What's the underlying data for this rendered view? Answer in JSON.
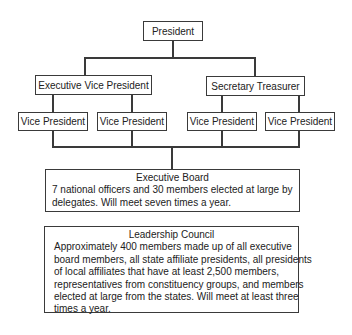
{
  "org_chart": {
    "nodes": {
      "president": "President",
      "executive_vice_president": "Executive Vice President",
      "secretary_treasurer": "Secretary Treasurer",
      "vice_presidents": [
        "Vice President",
        "Vice President",
        "Vice President",
        "Vice President"
      ]
    },
    "executive_board": {
      "title": "Executive Board",
      "lines": [
        "7 national officers and 30 members elected at large by",
        "delegates. Will meet seven times a year."
      ]
    },
    "leadership_council": {
      "title": "Leadership Council",
      "lines": [
        "Approximately 400 members made up of all executive",
        "board members, all state affiliate presidents, all presidents",
        "of local affiliates that have at least 2,500 members,",
        "representatives from constituency groups, and members",
        "elected at large from the states. Will meet at least three",
        "times a year."
      ]
    },
    "colors": {
      "background": "#ffffff",
      "line": "#3a3a3a",
      "text": "#222222"
    }
  }
}
